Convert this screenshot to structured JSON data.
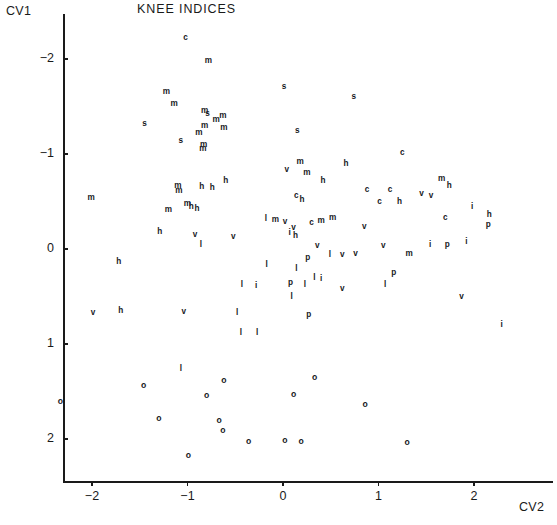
{
  "chart_data": {
    "type": "scatter",
    "title": "KNEE INDICES",
    "xlabel": "CV2",
    "ylabel": "CV1",
    "xticks": [
      -2,
      -1,
      0,
      1,
      2
    ],
    "yticks": [
      -2,
      -1,
      0,
      1,
      2
    ],
    "xticklabels": [
      "−2",
      "−1",
      "0",
      "1",
      "2"
    ],
    "yticklabels": [
      "−2",
      "−1",
      "0",
      "1",
      "2"
    ],
    "xlim": [
      -2.55,
      2.85
    ],
    "ylim": [
      -2.45,
      2.55
    ],
    "y_axis_inverted": true,
    "grid": false,
    "legend": null,
    "marker_style": "text-letter-codes",
    "group_codes": [
      "c",
      "m",
      "s",
      "h",
      "v",
      "i",
      "l",
      "p",
      "o"
    ],
    "points": [
      {
        "label": "c",
        "x": -1.02,
        "y": -2.22
      },
      {
        "label": "m",
        "x": -0.78,
        "y": -1.98
      },
      {
        "label": "s",
        "x": 0.01,
        "y": -1.71
      },
      {
        "label": "m",
        "x": -1.22,
        "y": -1.65
      },
      {
        "label": "s",
        "x": 0.74,
        "y": -1.6
      },
      {
        "label": "m",
        "x": -1.14,
        "y": -1.53
      },
      {
        "label": "m",
        "x": -0.82,
        "y": -1.45
      },
      {
        "label": "s",
        "x": -0.79,
        "y": -1.42
      },
      {
        "label": "m",
        "x": -0.63,
        "y": -1.4
      },
      {
        "label": "m",
        "x": -0.7,
        "y": -1.36
      },
      {
        "label": "s",
        "x": -1.45,
        "y": -1.32
      },
      {
        "label": "m",
        "x": -0.82,
        "y": -1.3
      },
      {
        "label": "m",
        "x": -0.62,
        "y": -1.27
      },
      {
        "label": "s",
        "x": 0.15,
        "y": -1.24
      },
      {
        "label": "m",
        "x": -0.88,
        "y": -1.22
      },
      {
        "label": "s",
        "x": -1.07,
        "y": -1.14
      },
      {
        "label": "m",
        "x": -0.83,
        "y": -1.1
      },
      {
        "label": "m",
        "x": -0.84,
        "y": -1.05
      },
      {
        "label": "c",
        "x": 1.25,
        "y": -1.01
      },
      {
        "label": "m",
        "x": 0.18,
        "y": -0.92
      },
      {
        "label": "h",
        "x": 0.66,
        "y": -0.9
      },
      {
        "label": "v",
        "x": 0.04,
        "y": -0.83
      },
      {
        "label": "m",
        "x": 0.25,
        "y": -0.8
      },
      {
        "label": "m",
        "x": 1.66,
        "y": -0.74
      },
      {
        "label": "h",
        "x": -0.6,
        "y": -0.72
      },
      {
        "label": "h",
        "x": 0.42,
        "y": -0.72
      },
      {
        "label": "h",
        "x": 1.74,
        "y": -0.66
      },
      {
        "label": "m",
        "x": -1.1,
        "y": -0.66
      },
      {
        "label": "m",
        "x": -1.09,
        "y": -0.61
      },
      {
        "label": "h",
        "x": -0.85,
        "y": -0.65
      },
      {
        "label": "h",
        "x": -0.74,
        "y": -0.64
      },
      {
        "label": "c",
        "x": 0.88,
        "y": -0.62
      },
      {
        "label": "c",
        "x": 1.12,
        "y": -0.62
      },
      {
        "label": "v",
        "x": 1.45,
        "y": -0.58
      },
      {
        "label": "v",
        "x": 1.55,
        "y": -0.56
      },
      {
        "label": "c",
        "x": 0.14,
        "y": -0.56
      },
      {
        "label": "h",
        "x": 0.2,
        "y": -0.52
      },
      {
        "label": "m",
        "x": -2.01,
        "y": -0.54
      },
      {
        "label": "h",
        "x": 1.22,
        "y": -0.5
      },
      {
        "label": "c",
        "x": 1.01,
        "y": -0.49
      },
      {
        "label": "m",
        "x": -1.0,
        "y": -0.47
      },
      {
        "label": "h",
        "x": -0.96,
        "y": -0.44
      },
      {
        "label": "h",
        "x": -0.9,
        "y": -0.42
      },
      {
        "label": "i",
        "x": 1.98,
        "y": -0.44
      },
      {
        "label": "m",
        "x": -1.2,
        "y": -0.41
      },
      {
        "label": "h",
        "x": 2.16,
        "y": -0.36
      },
      {
        "label": "m",
        "x": 0.52,
        "y": -0.33
      },
      {
        "label": "c",
        "x": 1.7,
        "y": -0.33
      },
      {
        "label": "l",
        "x": -0.18,
        "y": -0.32
      },
      {
        "label": "m",
        "x": -0.08,
        "y": -0.31
      },
      {
        "label": "c",
        "x": 0.3,
        "y": -0.27
      },
      {
        "label": "m",
        "x": 0.4,
        "y": -0.29
      },
      {
        "label": "v",
        "x": 0.02,
        "y": -0.28
      },
      {
        "label": "p",
        "x": 2.15,
        "y": -0.25
      },
      {
        "label": "v",
        "x": 0.11,
        "y": -0.22
      },
      {
        "label": "h",
        "x": -1.29,
        "y": -0.18
      },
      {
        "label": "v",
        "x": 0.85,
        "y": -0.23
      },
      {
        "label": "i",
        "x": 0.07,
        "y": -0.17
      },
      {
        "label": "h",
        "x": 0.13,
        "y": -0.14
      },
      {
        "label": "v",
        "x": -0.92,
        "y": -0.15
      },
      {
        "label": "v",
        "x": -0.52,
        "y": -0.13
      },
      {
        "label": "l",
        "x": -0.86,
        "y": -0.04
      },
      {
        "label": "v",
        "x": 0.36,
        "y": -0.03
      },
      {
        "label": "i",
        "x": 1.54,
        "y": -0.04
      },
      {
        "label": "p",
        "x": 1.72,
        "y": -0.04
      },
      {
        "label": "i",
        "x": 1.92,
        "y": -0.07
      },
      {
        "label": "v",
        "x": 1.05,
        "y": -0.03
      },
      {
        "label": "m",
        "x": 1.32,
        "y": 0.05
      },
      {
        "label": "p",
        "x": 0.26,
        "y": 0.09
      },
      {
        "label": "l",
        "x": 0.49,
        "y": 0.06
      },
      {
        "label": "v",
        "x": 0.62,
        "y": 0.06
      },
      {
        "label": "v",
        "x": 0.76,
        "y": 0.05
      },
      {
        "label": "h",
        "x": -1.72,
        "y": 0.14
      },
      {
        "label": "l",
        "x": -0.17,
        "y": 0.17
      },
      {
        "label": "l",
        "x": 0.14,
        "y": 0.21
      },
      {
        "label": "p",
        "x": 1.16,
        "y": 0.25
      },
      {
        "label": "l",
        "x": 0.33,
        "y": 0.31
      },
      {
        "label": "i",
        "x": 0.4,
        "y": 0.32
      },
      {
        "label": "l",
        "x": -0.43,
        "y": 0.38
      },
      {
        "label": "i",
        "x": -0.28,
        "y": 0.39
      },
      {
        "label": "l",
        "x": 0.23,
        "y": 0.38
      },
      {
        "label": "p",
        "x": 0.08,
        "y": 0.36
      },
      {
        "label": "l",
        "x": 1.07,
        "y": 0.38
      },
      {
        "label": "v",
        "x": 0.62,
        "y": 0.42
      },
      {
        "label": "l",
        "x": 0.09,
        "y": 0.5
      },
      {
        "label": "v",
        "x": 1.87,
        "y": 0.51
      },
      {
        "label": "h",
        "x": -1.7,
        "y": 0.65
      },
      {
        "label": "v",
        "x": -1.99,
        "y": 0.67
      },
      {
        "label": "v",
        "x": -1.04,
        "y": 0.66
      },
      {
        "label": "l",
        "x": -0.48,
        "y": 0.67
      },
      {
        "label": "p",
        "x": 0.27,
        "y": 0.69
      },
      {
        "label": "i",
        "x": 2.29,
        "y": 0.8
      },
      {
        "label": "l",
        "x": -0.44,
        "y": 0.88
      },
      {
        "label": "l",
        "x": -0.27,
        "y": 0.88
      },
      {
        "label": "l",
        "x": -1.07,
        "y": 1.26
      },
      {
        "label": "o",
        "x": -1.46,
        "y": 1.43
      },
      {
        "label": "o",
        "x": -0.62,
        "y": 1.38
      },
      {
        "label": "o",
        "x": -2.33,
        "y": 1.6
      },
      {
        "label": "o",
        "x": -0.8,
        "y": 1.54
      },
      {
        "label": "o",
        "x": 0.11,
        "y": 1.53
      },
      {
        "label": "o",
        "x": 0.33,
        "y": 1.35
      },
      {
        "label": "o",
        "x": -1.3,
        "y": 1.78
      },
      {
        "label": "o",
        "x": 0.86,
        "y": 1.63
      },
      {
        "label": "o",
        "x": -0.67,
        "y": 1.8
      },
      {
        "label": "o",
        "x": -0.63,
        "y": 1.9
      },
      {
        "label": "o",
        "x": -0.36,
        "y": 2.02
      },
      {
        "label": "o",
        "x": 0.02,
        "y": 2.01
      },
      {
        "label": "o",
        "x": 0.19,
        "y": 2.02
      },
      {
        "label": "o",
        "x": 1.3,
        "y": 2.03
      },
      {
        "label": "o",
        "x": -0.99,
        "y": 2.17
      }
    ]
  }
}
